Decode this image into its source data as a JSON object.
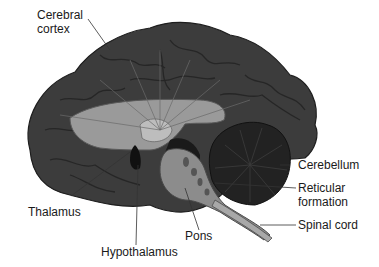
{
  "diagram": {
    "colors": {
      "cortex": "#3c3c3c",
      "cortex_dark": "#2a2a2a",
      "cerebellum": "#222222",
      "thalamus_region": "#9a9a9a",
      "brainstem": "#8c8c8c",
      "spinal_cord": "#a8a8a8",
      "label_text": "#1a1a1a",
      "leader_line": "#333333"
    },
    "labels": [
      {
        "id": "cerebral-cortex",
        "text": "Cerebral\ncortex"
      },
      {
        "id": "cerebellum",
        "text": "Cerebellum"
      },
      {
        "id": "reticular-formation",
        "text": "Reticular\nformation"
      },
      {
        "id": "spinal-cord",
        "text": "Spinal cord"
      },
      {
        "id": "thalamus",
        "text": "Thalamus"
      },
      {
        "id": "pons",
        "text": "Pons"
      },
      {
        "id": "hypothalamus",
        "text": "Hypothalamus"
      }
    ]
  }
}
